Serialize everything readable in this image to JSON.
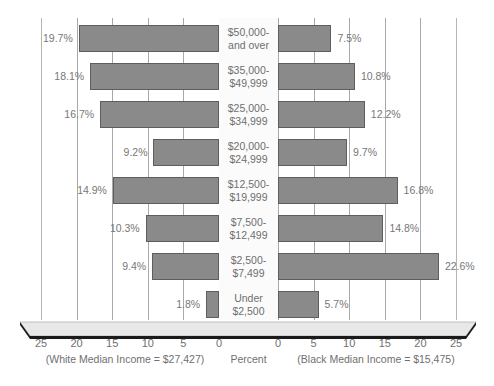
{
  "chart_data": {
    "type": "bar",
    "title": "",
    "subtitle": "",
    "orientation": "horizontal",
    "layout": "population-pyramid-diverging",
    "xlabel": "Percent",
    "ylabel": "",
    "xlim": [
      0,
      25
    ],
    "grid": true,
    "legend_position": "none",
    "categories": [
      "$50,000- and over",
      "$35,000- $49,999",
      "$25,000- $34,999",
      "$20,000- $24,999",
      "$12,500- $19,999",
      "$7,500- $12,499",
      "$2,500- $7,499",
      "Under $2,500"
    ],
    "series": [
      {
        "name": "White",
        "side": "left",
        "values": [
          19.7,
          18.1,
          16.7,
          9.2,
          14.9,
          10.3,
          9.4,
          1.8
        ]
      },
      {
        "name": "Black",
        "side": "right",
        "values": [
          7.5,
          10.8,
          12.2,
          9.7,
          16.8,
          14.8,
          22.6,
          5.7
        ]
      }
    ],
    "axis_ticks_left": [
      "25",
      "20",
      "15",
      "10",
      "5",
      "0"
    ],
    "axis_ticks_right": [
      "0",
      "5",
      "10",
      "15",
      "20",
      "25"
    ],
    "annotations": [
      "(White Median Income = $27,427)",
      "Percent",
      "(Black Median Income = $15,475)"
    ],
    "colors": {
      "bar_fill": "#8a8a8a",
      "bar_stroke": "#5e5e5e",
      "gridline": "#a9a9a9",
      "text": "#6f6f6f",
      "background": "#ffffff"
    }
  },
  "rows": [
    {
      "label_line1": "$50,000-",
      "label_line2": "and over",
      "left_value": 19.7,
      "left_label": "19.7%",
      "right_value": 7.5,
      "right_label": "7.5%"
    },
    {
      "label_line1": "$35,000-",
      "label_line2": "$49,999",
      "left_value": 18.1,
      "left_label": "18.1%",
      "right_value": 10.8,
      "right_label": "10.8%"
    },
    {
      "label_line1": "$25,000-",
      "label_line2": "$34,999",
      "left_value": 16.7,
      "left_label": "16.7%",
      "right_value": 12.2,
      "right_label": "12.2%"
    },
    {
      "label_line1": "$20,000-",
      "label_line2": "$24,999",
      "left_value": 9.2,
      "left_label": "9.2%",
      "right_value": 9.7,
      "right_label": "9.7%"
    },
    {
      "label_line1": "$12,500-",
      "label_line2": "$19,999",
      "left_value": 14.9,
      "left_label": "14.9%",
      "right_value": 16.8,
      "right_label": "16.8%"
    },
    {
      "label_line1": "$7,500-",
      "label_line2": "$12,499",
      "left_value": 10.3,
      "left_label": "10.3%",
      "right_value": 14.8,
      "right_label": "14.8%"
    },
    {
      "label_line1": "$2,500-",
      "label_line2": "$7,499",
      "left_value": 9.4,
      "left_label": "9.4%",
      "right_value": 22.6,
      "right_label": "22.6%"
    },
    {
      "label_line1": "Under",
      "label_line2": "$2,500",
      "left_value": 1.8,
      "left_label": "1.8%",
      "right_value": 5.7,
      "right_label": "5.7%"
    }
  ],
  "axis": {
    "left_ticks": [
      "25",
      "20",
      "15",
      "10",
      "5",
      "0"
    ],
    "right_ticks": [
      "0",
      "5",
      "10",
      "15",
      "20",
      "25"
    ]
  },
  "captions": {
    "left": "(White Median Income = $27,427)",
    "center": "Percent",
    "right": "(Black Median Income = $15,475)"
  }
}
